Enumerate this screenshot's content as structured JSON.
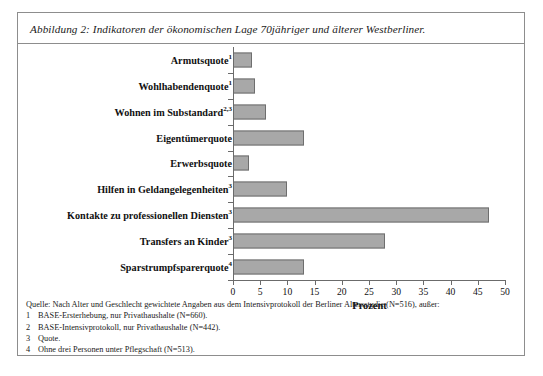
{
  "figure": {
    "caption": "Abbildung 2: Indikatoren der ökonomischen Lage 70jähriger und älterer Westberliner.",
    "source_line": "Quelle: Nach Alter und Geschlecht gewichtete Angaben aus dem Intensivprotokoll der Berliner Altersstudie (N=516), außer:",
    "footnotes": [
      {
        "num": "1",
        "text": "BASE-Ersterhebung, nur Privathaushalte (N=660)."
      },
      {
        "num": "2",
        "text": "BASE-Intensivprotokoll, nur Privathaushalte (N=442)."
      },
      {
        "num": "3",
        "text": "Quote."
      },
      {
        "num": "4",
        "text": "Ohne drei Personen unter Pflegschaft (N=513)."
      }
    ]
  },
  "chart_data": {
    "type": "bar",
    "orientation": "horizontal",
    "title": "Abbildung 2: Indikatoren der ökonomischen Lage 70jähriger und älterer Westberliner.",
    "xlabel": "Prozent",
    "ylabel": "",
    "xlim": [
      0,
      50
    ],
    "xticks": [
      0,
      5,
      10,
      15,
      20,
      25,
      30,
      35,
      40,
      45,
      50
    ],
    "grid": false,
    "legend": null,
    "bar_color": "#a8a8a8",
    "bar_edge_color": "#6e6e6e",
    "categories": [
      "Armutsquote",
      "Wohlhabendenquote",
      "Wohnen im Substandard",
      "Eigentümerquote",
      "Erwerbsquote",
      "Hilfen in Geldangelegenheiten",
      "Kontakte zu professionellen Diensten",
      "Transfers an Kinder",
      "Sparstrumpfsparerquote"
    ],
    "category_superscripts": [
      "1",
      "1",
      "2,3",
      "",
      "",
      "3",
      "3",
      "3",
      "4"
    ],
    "values": [
      3.5,
      4.0,
      6.0,
      13.0,
      3.0,
      10.0,
      47.0,
      28.0,
      13.0
    ]
  }
}
